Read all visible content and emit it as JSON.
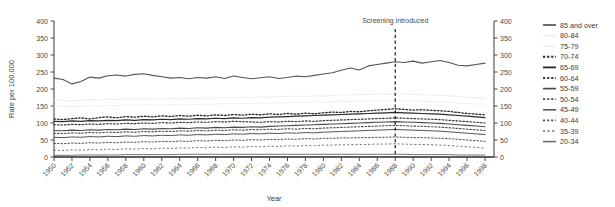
{
  "top_cropped_text": " ",
  "chart_data": {
    "type": "line",
    "title": "",
    "xlabel": "Year",
    "ylabel": "Rate per 100,000",
    "xlim": [
      1950,
      1999
    ],
    "ylim": [
      0,
      400
    ],
    "yticks": [
      0,
      50,
      100,
      150,
      200,
      250,
      300,
      350,
      400
    ],
    "xticks": [
      1950,
      1952,
      1954,
      1956,
      1958,
      1960,
      1962,
      1964,
      1966,
      1968,
      1970,
      1972,
      1974,
      1976,
      1978,
      1980,
      1982,
      1984,
      1986,
      1988,
      1990,
      1992,
      1994,
      1996,
      1998
    ],
    "grid": false,
    "dual_y_axis": true,
    "legend_position": "right",
    "annotations": [
      {
        "label": "Screening introduced",
        "x": 1988,
        "style": "dashed-vline"
      }
    ],
    "x": [
      1950,
      1951,
      1952,
      1953,
      1954,
      1955,
      1956,
      1957,
      1958,
      1959,
      1960,
      1961,
      1962,
      1963,
      1964,
      1965,
      1966,
      1967,
      1968,
      1969,
      1970,
      1971,
      1972,
      1973,
      1974,
      1975,
      1976,
      1977,
      1978,
      1979,
      1980,
      1981,
      1982,
      1983,
      1984,
      1985,
      1986,
      1987,
      1988,
      1989,
      1990,
      1991,
      1992,
      1993,
      1994,
      1995,
      1996,
      1997,
      1998
    ],
    "series": [
      {
        "name": "85 and over",
        "style": "solid",
        "color": "#555555",
        "width": 1.1,
        "values": [
          232,
          228,
          215,
          222,
          235,
          232,
          239,
          241,
          238,
          243,
          245,
          240,
          236,
          232,
          234,
          230,
          234,
          232,
          236,
          231,
          238,
          234,
          230,
          233,
          236,
          231,
          234,
          238,
          236,
          240,
          244,
          248,
          255,
          262,
          256,
          268,
          272,
          276,
          280,
          278,
          282,
          276,
          280,
          284,
          278,
          270,
          268,
          272,
          276
        ]
      },
      {
        "name": "80-84",
        "style": "solid",
        "color": "#ededf0",
        "width": 1.0,
        "values": [
          168,
          166,
          165,
          167,
          169,
          168,
          170,
          169,
          171,
          170,
          172,
          171,
          170,
          172,
          171,
          173,
          172,
          174,
          173,
          175,
          174,
          176,
          175,
          177,
          176,
          178,
          177,
          179,
          178,
          180,
          179,
          181,
          183,
          182,
          184,
          183,
          185,
          184,
          186,
          185,
          184,
          183,
          182,
          181,
          180,
          178,
          176,
          175,
          174
        ]
      },
      {
        "name": "75-79",
        "style": "solid",
        "color": "#f0f0f3",
        "width": 1.0,
        "values": [
          150,
          149,
          148,
          150,
          151,
          150,
          152,
          151,
          153,
          152,
          154,
          153,
          152,
          154,
          153,
          155,
          154,
          156,
          155,
          157,
          156,
          158,
          157,
          159,
          158,
          160,
          159,
          161,
          160,
          162,
          161,
          163,
          164,
          163,
          165,
          164,
          166,
          165,
          167,
          166,
          165,
          164,
          163,
          162,
          161,
          159,
          157,
          156,
          155
        ]
      },
      {
        "name": "70-74",
        "style": "dotted",
        "color": "#2a2a2a",
        "width": 1.3,
        "values": [
          112,
          110,
          113,
          115,
          112,
          116,
          118,
          115,
          119,
          117,
          120,
          118,
          121,
          119,
          122,
          120,
          123,
          121,
          124,
          122,
          125,
          123,
          126,
          124,
          127,
          125,
          128,
          126,
          129,
          127,
          130,
          132,
          131,
          134,
          133,
          136,
          138,
          140,
          142,
          140,
          138,
          139,
          137,
          136,
          134,
          131,
          128,
          126,
          124
        ]
      },
      {
        "name": "65-69",
        "style": "solid",
        "color": "#2a2a2a",
        "width": 1.2,
        "values": [
          105,
          104,
          106,
          105,
          107,
          106,
          108,
          107,
          109,
          108,
          110,
          109,
          111,
          110,
          112,
          111,
          113,
          112,
          114,
          113,
          115,
          114,
          116,
          115,
          117,
          118,
          119,
          120,
          121,
          122,
          123,
          124,
          125,
          126,
          127,
          128,
          129,
          130,
          131,
          130,
          129,
          128,
          127,
          126,
          124,
          122,
          120,
          118,
          116
        ]
      },
      {
        "name": "60-64",
        "style": "dotted",
        "color": "#3a3a3a",
        "width": 1.2,
        "values": [
          95,
          94,
          96,
          95,
          97,
          96,
          98,
          97,
          99,
          98,
          100,
          99,
          101,
          100,
          102,
          101,
          103,
          102,
          104,
          103,
          105,
          104,
          103,
          102,
          104,
          103,
          105,
          104,
          106,
          105,
          107,
          108,
          109,
          110,
          111,
          112,
          113,
          114,
          115,
          114,
          113,
          112,
          111,
          110,
          108,
          106,
          104,
          102,
          100
        ]
      },
      {
        "name": "55-59",
        "style": "solid",
        "color": "#4a4a4a",
        "width": 1.1,
        "values": [
          78,
          77,
          79,
          78,
          80,
          79,
          81,
          80,
          82,
          81,
          83,
          82,
          84,
          83,
          85,
          84,
          86,
          85,
          87,
          86,
          88,
          87,
          89,
          88,
          90,
          91,
          92,
          93,
          94,
          95,
          96,
          97,
          98,
          99,
          100,
          101,
          102,
          103,
          104,
          103,
          102,
          101,
          100,
          99,
          97,
          95,
          93,
          91,
          89
        ]
      },
      {
        "name": "50-54",
        "style": "dotted",
        "color": "#4a4a4a",
        "width": 1.1,
        "values": [
          70,
          69,
          71,
          70,
          72,
          71,
          73,
          72,
          74,
          73,
          75,
          74,
          76,
          75,
          77,
          76,
          78,
          77,
          79,
          78,
          80,
          79,
          81,
          80,
          82,
          81,
          83,
          82,
          84,
          83,
          85,
          86,
          87,
          88,
          89,
          90,
          91,
          92,
          93,
          92,
          91,
          90,
          89,
          88,
          86,
          84,
          82,
          80,
          78
        ]
      },
      {
        "name": "45-49",
        "style": "solid",
        "color": "#555555",
        "width": 1.0,
        "values": [
          58,
          57,
          59,
          58,
          60,
          59,
          61,
          60,
          62,
          61,
          63,
          62,
          64,
          63,
          65,
          64,
          66,
          65,
          67,
          66,
          68,
          67,
          69,
          68,
          70,
          69,
          71,
          70,
          72,
          71,
          73,
          74,
          75,
          76,
          77,
          78,
          79,
          80,
          81,
          80,
          79,
          78,
          77,
          76,
          74,
          72,
          70,
          68,
          66
        ]
      },
      {
        "name": "40-44",
        "style": "dotted",
        "color": "#555555",
        "width": 1.0,
        "values": [
          40,
          39,
          41,
          40,
          42,
          41,
          43,
          42,
          44,
          43,
          45,
          44,
          46,
          45,
          47,
          46,
          48,
          47,
          49,
          48,
          50,
          49,
          51,
          50,
          52,
          51,
          53,
          52,
          54,
          53,
          55,
          55,
          56,
          56,
          57,
          57,
          58,
          58,
          59,
          58,
          57,
          57,
          56,
          55,
          54,
          52,
          50,
          48,
          46
        ]
      },
      {
        "name": "35-39",
        "style": "dotted-sparse",
        "color": "#666666",
        "width": 0.9,
        "values": [
          20,
          19,
          21,
          20,
          22,
          21,
          23,
          22,
          24,
          23,
          25,
          24,
          26,
          25,
          27,
          26,
          28,
          27,
          29,
          28,
          30,
          29,
          31,
          30,
          32,
          31,
          33,
          32,
          34,
          33,
          35,
          35,
          36,
          36,
          37,
          37,
          38,
          38,
          39,
          38,
          37,
          37,
          36,
          35,
          34,
          32,
          30,
          28,
          26
        ]
      },
      {
        "name": "20-34",
        "style": "solid",
        "color": "#666666",
        "width": 0.9,
        "values": [
          5,
          5,
          5,
          6,
          6,
          6,
          6,
          6,
          7,
          7,
          7,
          7,
          7,
          7,
          8,
          8,
          8,
          8,
          8,
          8,
          8,
          8,
          8,
          8,
          8,
          8,
          8,
          8,
          8,
          8,
          8,
          8,
          8,
          8,
          8,
          8,
          8,
          8,
          8,
          8,
          7,
          7,
          7,
          7,
          7,
          6,
          6,
          6,
          6
        ]
      }
    ]
  },
  "legend": {
    "items": [
      {
        "label": "85 and over"
      },
      {
        "label": "80-84"
      },
      {
        "label": "75-79"
      },
      {
        "label": "70-74"
      },
      {
        "label": "65-69"
      },
      {
        "label": "60-64"
      },
      {
        "label": "55-59"
      },
      {
        "label": "50-54"
      },
      {
        "label": "45-49"
      },
      {
        "label": "40-44"
      },
      {
        "label": "35-39"
      },
      {
        "label": "20-34"
      }
    ]
  }
}
